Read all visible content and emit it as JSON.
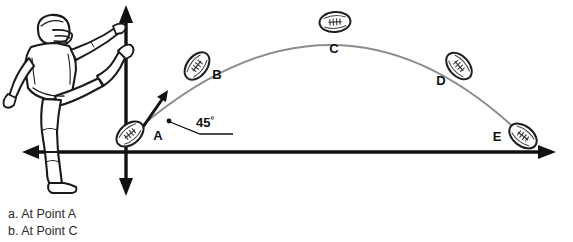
{
  "figure": {
    "background_color": "#ffffff",
    "axis_color": "#111111",
    "trajectory_color": "#8c8c8c",
    "ball_outline_color": "#222222",
    "player_outline_color": "#1a1a1a"
  },
  "axes": {
    "origin": {
      "x": 126,
      "y": 152
    },
    "vertical_axis_name": "vertical-axis",
    "horizontal_axis_name": "horizontal-axis",
    "arrowheads": [
      "up",
      "down",
      "left",
      "right"
    ]
  },
  "velocity_vector": {
    "label": "45",
    "degree_symbol": "º",
    "full_label": "45º",
    "description": "launch angle"
  },
  "points": [
    {
      "id": "A",
      "label": "A",
      "ball_x": 130,
      "ball_y": 134,
      "label_x": 158,
      "label_y": 140
    },
    {
      "id": "B",
      "label": "B",
      "ball_x": 197,
      "ball_y": 66,
      "label_x": 217,
      "label_y": 79
    },
    {
      "id": "C",
      "label": "C",
      "ball_x": 335,
      "ball_y": 22,
      "label_x": 334,
      "label_y": 53
    },
    {
      "id": "D",
      "label": "D",
      "ball_x": 459,
      "ball_y": 66,
      "label_x": 441,
      "label_y": 85
    },
    {
      "id": "E",
      "label": "E",
      "ball_x": 523,
      "ball_y": 136,
      "label_x": 497,
      "label_y": 141
    }
  ],
  "caption": {
    "lines": [
      "a. At Point A",
      "b. At Point C"
    ]
  }
}
